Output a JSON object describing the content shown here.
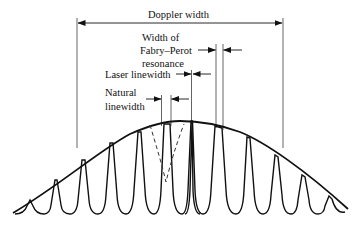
{
  "diagram": {
    "labels": {
      "doppler_width": "Doppler width",
      "fp_line1": "Width of",
      "fp_line2": "Fabry–Perot",
      "fp_line3": "resonance",
      "laser_linewidth": "Laser linewidth",
      "natural_line1": "Natural",
      "natural_line2": "linewidth"
    },
    "envelope": {
      "shape": "Gaussian (Doppler profile)",
      "apex_x": 180,
      "apex_y": 121,
      "baseline_y": 214
    },
    "modes_peak_x": [
      30,
      57,
      85,
      113,
      141,
      167,
      192,
      219,
      248,
      276,
      304,
      330
    ],
    "natural_profile": {
      "center_x": 167,
      "style": "dashed"
    },
    "colors": {
      "ink": "#111111",
      "background": "#ffffff"
    }
  }
}
